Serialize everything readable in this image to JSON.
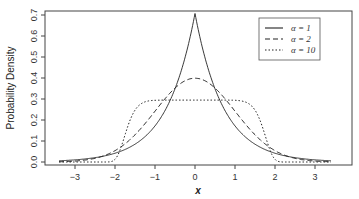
{
  "chart_data": {
    "type": "line",
    "title": "",
    "xlabel": "x",
    "ylabel": "Probability Density",
    "xlim": [
      -3.5,
      3.5
    ],
    "ylim": [
      0.0,
      0.7
    ],
    "x_ticks": [
      "-3",
      "-2",
      "-1",
      "0",
      "1",
      "2",
      "3"
    ],
    "y_ticks": [
      "0.0",
      "0.1",
      "0.2",
      "0.3",
      "0.4",
      "0.5",
      "0.6",
      "0.7"
    ],
    "grid": false,
    "legend_position": "top-right",
    "series": [
      {
        "name": "α = 1",
        "style": "solid",
        "alpha": 1,
        "peak": 0.707,
        "x": [
          -3.4,
          -3,
          -2,
          -1,
          -0.5,
          0,
          0.5,
          1,
          2,
          3,
          3.4
        ],
        "values": [
          0.006,
          0.01,
          0.042,
          0.171,
          0.348,
          0.707,
          0.348,
          0.171,
          0.042,
          0.01,
          0.006
        ]
      },
      {
        "name": "α = 2",
        "style": "dashed",
        "alpha": 2,
        "peak": 0.399,
        "x": [
          -3.4,
          -3,
          -2,
          -1,
          -0.5,
          0,
          0.5,
          1,
          2,
          3,
          3.4
        ],
        "values": [
          0.001,
          0.004,
          0.054,
          0.242,
          0.352,
          0.399,
          0.352,
          0.242,
          0.054,
          0.004,
          0.001
        ]
      },
      {
        "name": "α = 10",
        "style": "dotted",
        "alpha": 10,
        "peak": 0.295,
        "x": [
          -3.4,
          -2,
          -1.8,
          -1.6,
          -1,
          0,
          1,
          1.6,
          1.8,
          2,
          3.4
        ],
        "values": [
          0.0,
          0.012,
          0.108,
          0.231,
          0.295,
          0.295,
          0.295,
          0.231,
          0.108,
          0.012,
          0.0
        ]
      }
    ]
  },
  "legend": {
    "items": [
      {
        "label": "α = 1",
        "dash": ""
      },
      {
        "label": "α = 2",
        "dash": "5,3"
      },
      {
        "label": "α = 10",
        "dash": "1.5,2"
      }
    ]
  },
  "axes": {
    "xlabel": "x",
    "ylabel": "Probability Density"
  }
}
